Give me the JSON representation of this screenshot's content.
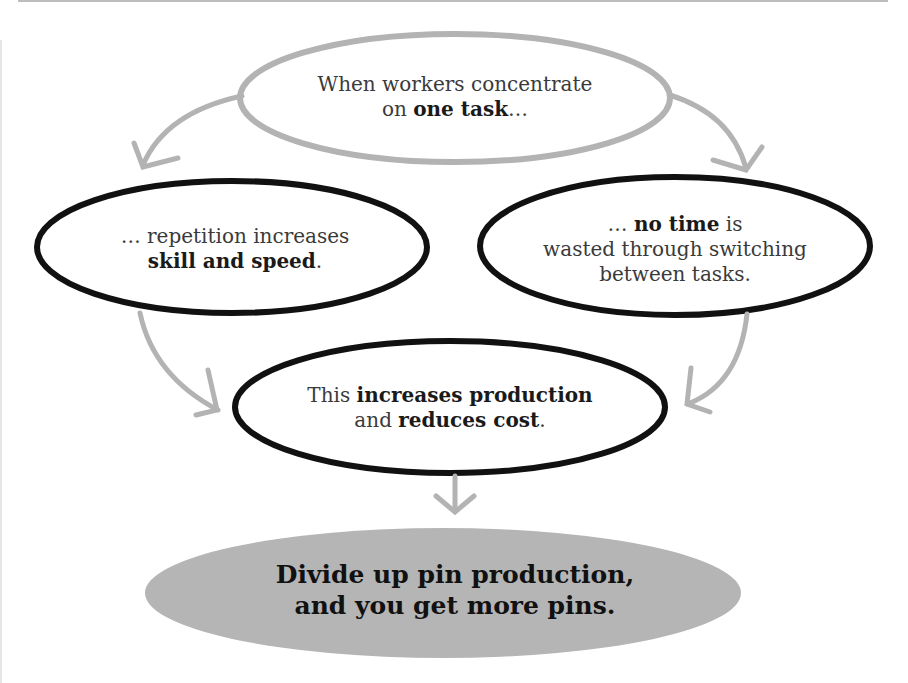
{
  "diagram": {
    "top_node": {
      "line1": "When workers concentrate",
      "line2_prefix": "on ",
      "line2_bold": "one task",
      "line2_suffix": "…"
    },
    "left_node": {
      "line1": "… repetition increases",
      "line2_bold": "skill and speed",
      "line2_suffix": "."
    },
    "right_node": {
      "line1_prefix": "… ",
      "line1_bold": "no time",
      "line1_suffix": " is",
      "line2": "wasted through switching",
      "line3": "between tasks."
    },
    "center_node": {
      "line1_prefix": "This ",
      "line1_bold": "increases production",
      "line2_prefix": "and ",
      "line2_bold": "reduces cost",
      "line2_suffix": "."
    },
    "conclusion_node": {
      "line1": "Divide up pin production,",
      "line2": "and you get more pins."
    },
    "colors": {
      "outline_dark": "#111111",
      "outline_light": "#b3b3b3",
      "arrow": "#b3b3b3",
      "conclusion_fill": "#b5b5b5",
      "text": "#3a3a3a"
    },
    "edges": [
      {
        "from": "top_node",
        "to": "left_node"
      },
      {
        "from": "top_node",
        "to": "right_node"
      },
      {
        "from": "left_node",
        "to": "center_node"
      },
      {
        "from": "right_node",
        "to": "center_node"
      },
      {
        "from": "center_node",
        "to": "conclusion_node"
      }
    ]
  }
}
